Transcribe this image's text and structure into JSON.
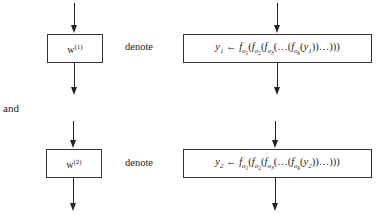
{
  "rows": [
    {
      "box_label": "w",
      "box_superscript": "(1)",
      "relation": "denote",
      "formula": {
        "lhs_var": "y",
        "lhs_sub": "1",
        "arrow": "←",
        "f": "f",
        "o": "o",
        "subs": [
          "1",
          "2",
          "3",
          "k"
        ],
        "inner_var": "y",
        "inner_sub": "1",
        "ellipsis": "…",
        "open": "(",
        "close_inner": "))",
        "close_outer": ")))"
      }
    },
    {
      "box_label": "w",
      "box_superscript": "(2)",
      "relation": "denote",
      "formula": {
        "lhs_var": "y",
        "lhs_sub": "2",
        "arrow": "←",
        "f": "f",
        "o": "o",
        "subs": [
          "1",
          "2",
          "3",
          "k"
        ],
        "inner_var": "y",
        "inner_sub": "2",
        "ellipsis": "…",
        "open": "(",
        "close_inner": "))",
        "close_outer": ")))"
      }
    }
  ],
  "connector": "and"
}
